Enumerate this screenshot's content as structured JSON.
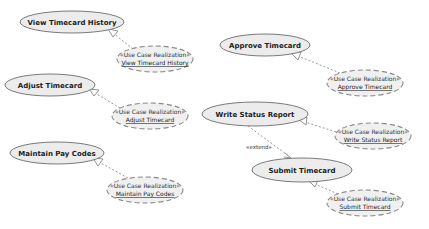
{
  "diagram": {
    "type": "UML use case diagram",
    "stereotype": "«Use Case Realization»",
    "use_cases": [
      {
        "id": "vth",
        "label": "View Timecard History",
        "cx": 72,
        "cy": 22,
        "rx": 52,
        "ry": 11
      },
      {
        "id": "adj",
        "label": "Adjust Timecard",
        "cx": 50,
        "cy": 85,
        "rx": 45,
        "ry": 11
      },
      {
        "id": "mpc",
        "label": "Maintain Pay Codes",
        "cx": 57,
        "cy": 153,
        "rx": 47,
        "ry": 11
      },
      {
        "id": "apr",
        "label": "Approve Timecard",
        "cx": 265,
        "cy": 45,
        "rx": 45,
        "ry": 11
      },
      {
        "id": "wsr",
        "label": "Write Status Report",
        "cx": 255,
        "cy": 114,
        "rx": 53,
        "ry": 12
      },
      {
        "id": "sub",
        "label": "Submit Timecard",
        "cx": 302,
        "cy": 170,
        "rx": 50,
        "ry": 12
      }
    ],
    "realizations": [
      {
        "id": "r_vth",
        "stereotype": "«Use Case Realization»",
        "name": "View Timecard History",
        "cx": 155,
        "cy": 59,
        "rx": 38,
        "ry": 13
      },
      {
        "id": "r_adj",
        "stereotype": "«Use Case Realization»",
        "name": "Adjust Timecard",
        "cx": 150,
        "cy": 116,
        "rx": 38,
        "ry": 13
      },
      {
        "id": "r_mpc",
        "stereotype": "«Use Case Realization»",
        "name": "Maintain Pay Codes",
        "cx": 145,
        "cy": 190,
        "rx": 38,
        "ry": 13
      },
      {
        "id": "r_apr",
        "stereotype": "«Use Case Realization»",
        "name": "Approve Timecard",
        "cx": 365,
        "cy": 83,
        "rx": 38,
        "ry": 13
      },
      {
        "id": "r_wsr",
        "stereotype": "«Use Case Realization»",
        "name": "Write Status Report",
        "cx": 373,
        "cy": 136,
        "rx": 38,
        "ry": 13
      },
      {
        "id": "r_sub",
        "stereotype": "«Use Case Realization»",
        "name": "Submit Timecard",
        "cx": 365,
        "cy": 203,
        "rx": 38,
        "ry": 13
      }
    ],
    "extend": {
      "label": "«extend»",
      "from": "wsr",
      "to": "sub"
    }
  }
}
